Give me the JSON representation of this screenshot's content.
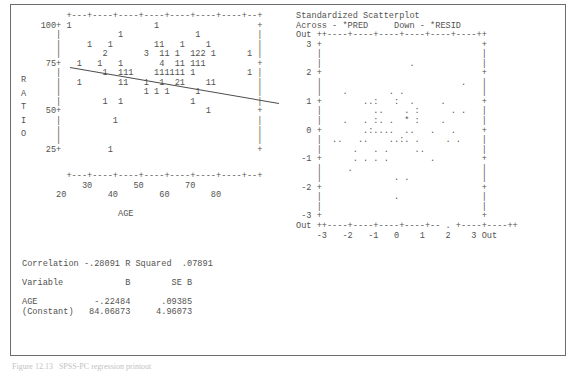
{
  "document": {
    "kind": "spss-regression-output",
    "caption": "Figure 12.13   SPSS-PC regression printout"
  },
  "left_plot": {
    "title": "",
    "ylabel": "RATIO",
    "xlabel": "AGE",
    "y_ticks": [
      "100+",
      "75+",
      "50+",
      "25+"
    ],
    "x_ticks_upper": [
      "30",
      "50",
      "70"
    ],
    "x_ticks_lower": [
      "20",
      "40",
      "60",
      "80"
    ],
    "art": [
      "         +---+----+----+----+----+----+----+--+",
      "    100+ 1                1                   +",
      "       |           1              1           |",
      "       |     1   1        11   1    1         |",
      "       |        2       3  11 1  122 1      1 |",
      "     75+   1   1   1       4  11 111          +",
      "       |        1  111    111111 1          1 |",
      "       |   1       11   1  1  21    11        |",
      "       |                1 1 1     1           |",
      "       |        1  1             1            |",
      "     50+                            1         +",
      "       |          1                           |",
      "       |                                      |",
      "       |                                      |",
      "     25+         1                            +"
    ],
    "xaxis_art": [
      "         +---+----+----+----+----+----+----+--+",
      "            30        50        70",
      "       20        40        60        80"
    ],
    "xlabel_art": "                   AGE"
  },
  "right_plot": {
    "title": "Standardized Scatterplot",
    "subtitle_across": "Across - *PRED",
    "subtitle_down": "Down - *RESID",
    "corner_top_left": "Out",
    "corner_bottom_left": "Out",
    "corner_bottom_right": "Out",
    "y_ticks": [
      "3",
      "2",
      "1",
      "0",
      "-1",
      "-2",
      "-3"
    ],
    "x_ticks": [
      "-3",
      "-2",
      "-1",
      "0",
      "1",
      "2",
      "3"
    ],
    "art": [
      "Standardized Scatterplot",
      "Across - *PRED     Down - *RESID",
      "Out ++----+----+----+----+----+----++",
      "  3 +                               +",
      "    |                               |",
      "    |                 .             |",
      "  2 +                               +",
      "    |                           .   |",
      "    |    .        . .               |",
      "  1 +        ..:   :  .     .       +",
      "    |          ..    . :      . .   |",
      "    |    .   . :. .  * :    .       |",
      "  0 +        .:....  ..   .   .     +",
      "    |  ..   ..    ..:. .     . .    |",
      "    |      .   . .     ..           |",
      " -1 +      . . . .        .         +",
      "    |     .                         |",
      "    |              . .              |",
      " -2 +                               +",
      "    |              .                |",
      "    |                               |",
      " -3 +                               +",
      "Out ++----+----+----+----+-- . +----+----++",
      "    -3   -2   -1   0    1    2    3 Out"
    ]
  },
  "stats": {
    "correlation_label": "Correlation",
    "correlation_value": "-.28091",
    "rsq_label": "R Squared",
    "rsq_value": ".07891",
    "columns": [
      "Variable",
      "B",
      "SE B"
    ],
    "rows": [
      {
        "variable": "AGE",
        "b": "-.22484",
        "se_b": ".09385"
      },
      {
        "variable": "(Constant)",
        "b": "84.06873",
        "se_b": "4.96073"
      }
    ],
    "art": [
      "Correlation -.28091 R Squared  .07891",
      "",
      "Variable            B        SE B",
      "",
      "AGE           -.22484      .09385",
      "(Constant)   84.06873     4.96073"
    ]
  },
  "colors": {
    "ink": "#53534f",
    "frame": "#6d6d6d",
    "paper": "#ffffff"
  }
}
